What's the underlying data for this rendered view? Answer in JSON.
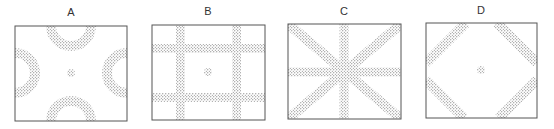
{
  "figure": {
    "panels": [
      {
        "id": "A",
        "label": "A",
        "pattern": "four half-rings on edges with central dot"
      },
      {
        "id": "B",
        "label": "B",
        "pattern": "two horizontal and two vertical stripes with central dot"
      },
      {
        "id": "C",
        "label": "C",
        "pattern": "eight-spoke star of stripes through center"
      },
      {
        "id": "D",
        "label": "D",
        "pattern": "four diagonal corner stripes forming diamond with central dot"
      }
    ],
    "colors": {
      "frame": "#555555",
      "stipple": "#6a6a6a",
      "background": "#ffffff"
    }
  }
}
